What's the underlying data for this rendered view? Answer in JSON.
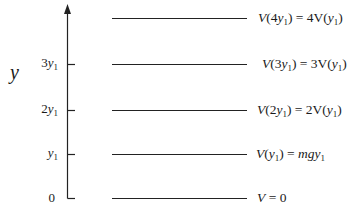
{
  "diagram": {
    "type": "energy-level-diagram",
    "axis": {
      "label": "y",
      "ticks": [
        {
          "label": "0",
          "y_level": 0
        },
        {
          "label": "y1",
          "y_level": 1
        },
        {
          "label": "2y1",
          "y_level": 2
        },
        {
          "label": "3y1",
          "y_level": 3
        }
      ]
    },
    "levels": [
      {
        "name": "level-0",
        "equation": "V = 0"
      },
      {
        "name": "level-1",
        "equation": "V(y1) = mgy1"
      },
      {
        "name": "level-2",
        "equation": "V(2y1) = 2V(y1)"
      },
      {
        "name": "level-3",
        "equation": "V(3y1) = 3V(y1)"
      },
      {
        "name": "level-4",
        "equation": "V(4y1) = 4V(y1)"
      }
    ]
  },
  "labels": {
    "axis_y": "y",
    "tick_0": "0",
    "tick_1_coef": "",
    "tick_2_coef": "2",
    "tick_3_coef": "3",
    "tick_var": "y",
    "tick_sub": "1",
    "eq0": "V = 0",
    "eq1_lhs": "V",
    "eq1_arg": "y",
    "eq1_sub": "1",
    "eq1_rhs": "mgy",
    "eq2_coef": "2",
    "eq3_coef": "3",
    "eq4_coef": "4",
    "V": "V",
    "V_up": "V",
    "y": "y",
    "sub1": "1"
  }
}
